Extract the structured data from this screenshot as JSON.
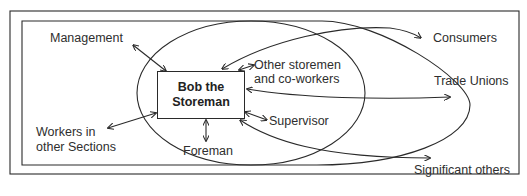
{
  "diagram": {
    "center": {
      "line1": "Bob the",
      "line2": "Storeman"
    },
    "labels": {
      "management": "Management",
      "other_storemen_line1": "Other storemen",
      "other_storemen_line2": "and co-workers",
      "consumers": "Consumers",
      "trade_unions": "Trade Unions",
      "supervisor": "Supervisor",
      "foreman": "Foreman",
      "workers_line1": "Workers in",
      "workers_line2": "other Sections",
      "significant_others": "Significant others"
    },
    "colors": {
      "line": "#2a2a2a",
      "background": "#ffffff"
    }
  }
}
